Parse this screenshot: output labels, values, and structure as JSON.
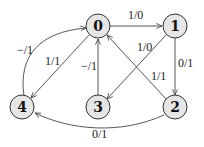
{
  "diagram": {
    "type": "directed-graph",
    "nodes": [
      {
        "id": "0",
        "label": "0"
      },
      {
        "id": "1",
        "label": "1"
      },
      {
        "id": "2",
        "label": "2"
      },
      {
        "id": "3",
        "label": "3"
      },
      {
        "id": "4",
        "label": "4"
      }
    ],
    "edges": [
      {
        "from": "0",
        "to": "1",
        "label": "1/0"
      },
      {
        "from": "1",
        "to": "3",
        "label": "1/0"
      },
      {
        "from": "1",
        "to": "2",
        "label": "0/1"
      },
      {
        "from": "2",
        "to": "0",
        "label": "1/1"
      },
      {
        "from": "3",
        "to": "0",
        "label": "−/1"
      },
      {
        "from": "0",
        "to": "4",
        "label": "1/1"
      },
      {
        "from": "4",
        "to": "0",
        "label": "−/1"
      },
      {
        "from": "2",
        "to": "4",
        "label": "0/1"
      }
    ]
  }
}
